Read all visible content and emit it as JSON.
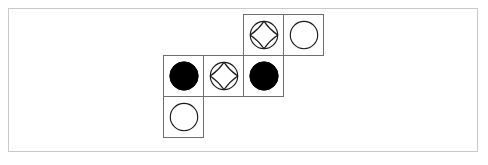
{
  "canvas": {
    "width": 488,
    "height": 165,
    "background": "#ffffff"
  },
  "frame": {
    "border_color": "#c9c9c9",
    "fill": "#ffffff",
    "x": 8,
    "y": 8,
    "width": 470,
    "height": 144
  },
  "board": {
    "cell_size": 41,
    "cell_border_color": "#6e6e6e",
    "cell_fill": "#ffffff",
    "piece_colors": {
      "black": "#000000",
      "white": "#ffffff",
      "outline": "#1a1a1a"
    },
    "cells": [
      {
        "id": "cell-r0-c2",
        "row": 0,
        "col": 2,
        "x": 243,
        "y": 14,
        "piece": "star-in-circle",
        "piece_label": "star-in-circle-icon",
        "fill": "#ffffff"
      },
      {
        "id": "cell-r0-c3",
        "row": 0,
        "col": 3,
        "x": 283,
        "y": 14,
        "piece": "white-circle",
        "piece_label": "white-circle-icon",
        "fill": "#ffffff"
      },
      {
        "id": "cell-r1-c0",
        "row": 1,
        "col": 0,
        "x": 163,
        "y": 55,
        "piece": "black-circle",
        "piece_label": "black-circle-icon",
        "fill": "#000000"
      },
      {
        "id": "cell-r1-c1",
        "row": 1,
        "col": 1,
        "x": 203,
        "y": 55,
        "piece": "star-in-circle",
        "piece_label": "star-in-circle-icon",
        "fill": "#ffffff"
      },
      {
        "id": "cell-r1-c2",
        "row": 1,
        "col": 2,
        "x": 243,
        "y": 55,
        "piece": "black-circle",
        "piece_label": "black-circle-icon",
        "fill": "#000000"
      },
      {
        "id": "cell-r2-c0",
        "row": 2,
        "col": 0,
        "x": 163,
        "y": 96,
        "piece": "white-circle",
        "piece_label": "white-circle-icon",
        "fill": "#ffffff"
      }
    ]
  }
}
